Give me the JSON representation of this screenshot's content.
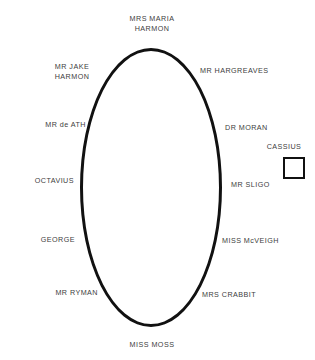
{
  "diagram": {
    "stroke_color": "#111111",
    "text_color": "#404040",
    "background_color": "#ffffff",
    "table": {
      "shape": "oval",
      "name": "dining-table"
    },
    "seats": [
      {
        "id": "mrs-maria-harmon",
        "label": "MRS MARIA\nHARMON",
        "position": "top"
      },
      {
        "id": "mr-jake-harmon",
        "label": "MR JAKE\nHARMON",
        "position": "upper-left"
      },
      {
        "id": "mr-hargreaves",
        "label": "MR HARGREAVES",
        "position": "upper-right"
      },
      {
        "id": "mr-de-ath",
        "label": "MR de ATH",
        "position": "left"
      },
      {
        "id": "dr-moran",
        "label": "DR MORAN",
        "position": "right"
      },
      {
        "id": "octavius",
        "label": "OCTAVIUS",
        "position": "mid-left"
      },
      {
        "id": "mr-sligo",
        "label": "MR SLIGO",
        "position": "mid-right"
      },
      {
        "id": "george",
        "label": "GEORGE",
        "position": "lower-left"
      },
      {
        "id": "miss-mcveigh",
        "label": "MISS McVEIGH",
        "position": "lower-right"
      },
      {
        "id": "mr-ryman",
        "label": "MR RYMAN",
        "position": "bottom-left"
      },
      {
        "id": "mrs-crabbit",
        "label": "MRS CRABBIT",
        "position": "bottom-right"
      },
      {
        "id": "miss-moss",
        "label": "MISS MOSS",
        "position": "bottom"
      }
    ],
    "aside": {
      "label": "CASSIUS",
      "shape": "square"
    }
  }
}
